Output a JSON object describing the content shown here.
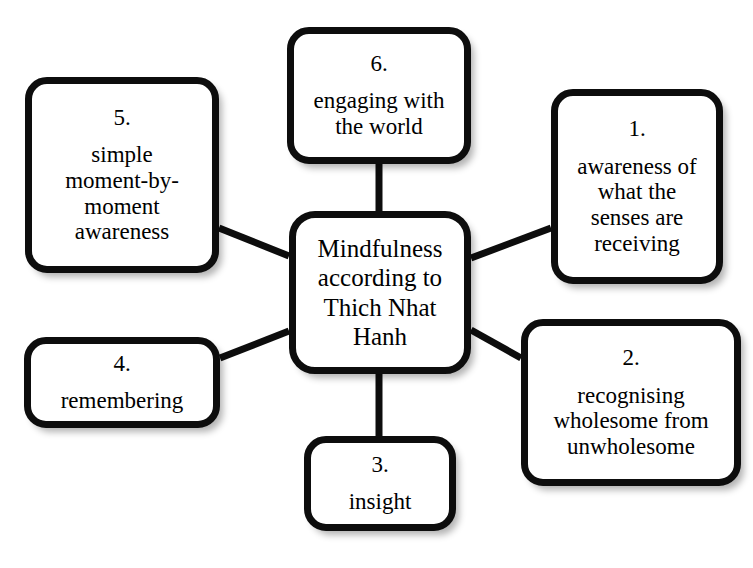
{
  "diagram": {
    "type": "mind-map",
    "center": {
      "label": "Mindfulness according to Thich Nhat Hanh"
    },
    "nodes": [
      {
        "index": "1.",
        "label": "awareness of\nwhat  the\nsenses are\nreceiving"
      },
      {
        "index": "2.",
        "label": "recognising\nwholesome from\nunwholesome"
      },
      {
        "index": "3.",
        "label": "insight"
      },
      {
        "index": "4.",
        "label": "remembering"
      },
      {
        "index": "5.",
        "label": "simple\nmoment-by-\nmoment\nawareness"
      },
      {
        "index": "6.",
        "label": "engaging with\nthe world"
      }
    ],
    "colors": {
      "node_border": "#0d0d0d",
      "node_fill": "#ffffff",
      "connector": "#0d0d0d",
      "text": "#000000",
      "background": "#ffffff"
    },
    "caption": ""
  }
}
